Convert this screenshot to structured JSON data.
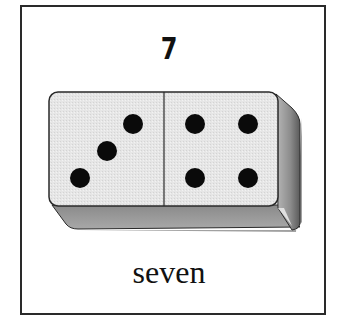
{
  "card": {
    "numeral": "7",
    "word": "seven"
  },
  "domino": {
    "left_half_pips": 3,
    "right_half_pips": 4,
    "total": 7,
    "colors": {
      "face": "#e8e8e8",
      "side": "#9a9a9a",
      "pip": "#0a0a0a",
      "outline": "#2a2a2a"
    }
  }
}
